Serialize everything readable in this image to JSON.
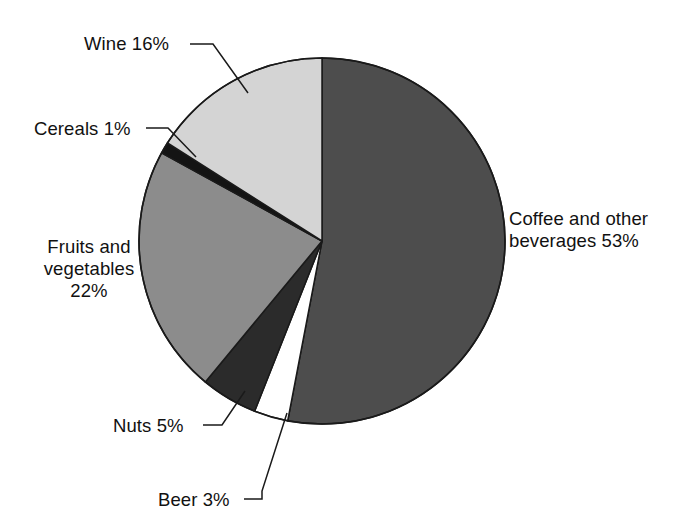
{
  "chart_data": {
    "type": "pie",
    "title": "",
    "subtitle": "",
    "xlabel": "",
    "ylabel": "",
    "legend_position": "none",
    "grid": false,
    "units": "percent",
    "start_angle_deg": 0,
    "direction": "clockwise",
    "categories": [
      "Coffee and other beverages",
      "Beer",
      "Nuts",
      "Fruits and vegetables",
      "Cereals",
      "Wine"
    ],
    "values": [
      53,
      3,
      5,
      22,
      1,
      16
    ],
    "slices": [
      {
        "key": "coffee",
        "name": "Coffee and other beverages",
        "value": 53,
        "value_text": "53%",
        "color": "#4d4d4d",
        "label_lines": [
          "Coffee and other",
          "beverages 53%"
        ],
        "has_leader_line": false
      },
      {
        "key": "beer",
        "name": "Beer",
        "value": 3,
        "value_text": "3%",
        "color": "#ffffff",
        "label_lines": [
          "Beer 3%"
        ],
        "has_leader_line": true
      },
      {
        "key": "nuts",
        "name": "Nuts",
        "value": 5,
        "value_text": "5%",
        "color": "#2b2b2b",
        "label_lines": [
          "Nuts 5%"
        ],
        "has_leader_line": true
      },
      {
        "key": "fruits",
        "name": "Fruits and vegetables",
        "value": 22,
        "value_text": "22%",
        "color": "#8c8c8c",
        "label_lines": [
          "Fruits and",
          "vegetables",
          "22%"
        ],
        "has_leader_line": false
      },
      {
        "key": "cereals",
        "name": "Cereals",
        "value": 1,
        "value_text": "1%",
        "color": "#141414",
        "label_lines": [
          "Cereals 1%"
        ],
        "has_leader_line": true
      },
      {
        "key": "wine",
        "name": "Wine",
        "value": 16,
        "value_text": "16%",
        "color": "#d4d4d4",
        "label_lines": [
          "Wine 16%"
        ],
        "has_leader_line": true
      }
    ]
  },
  "labels": {
    "wine": "Wine 16%",
    "cereals": "Cereals 1%",
    "fruits_line1": "Fruits and",
    "fruits_line2": "vegetables",
    "fruits_line3": "22%",
    "nuts": "Nuts 5%",
    "beer": "Beer 3%",
    "coffee_line1": "Coffee and other",
    "coffee_line2": "beverages 53%"
  },
  "geometry": {
    "center_x": 322,
    "center_y": 241,
    "radius": 183
  },
  "colors": {
    "background": "#ffffff",
    "outline": "#1a1a1a",
    "text": "#111111",
    "leader_line": "#1a1a1a"
  }
}
